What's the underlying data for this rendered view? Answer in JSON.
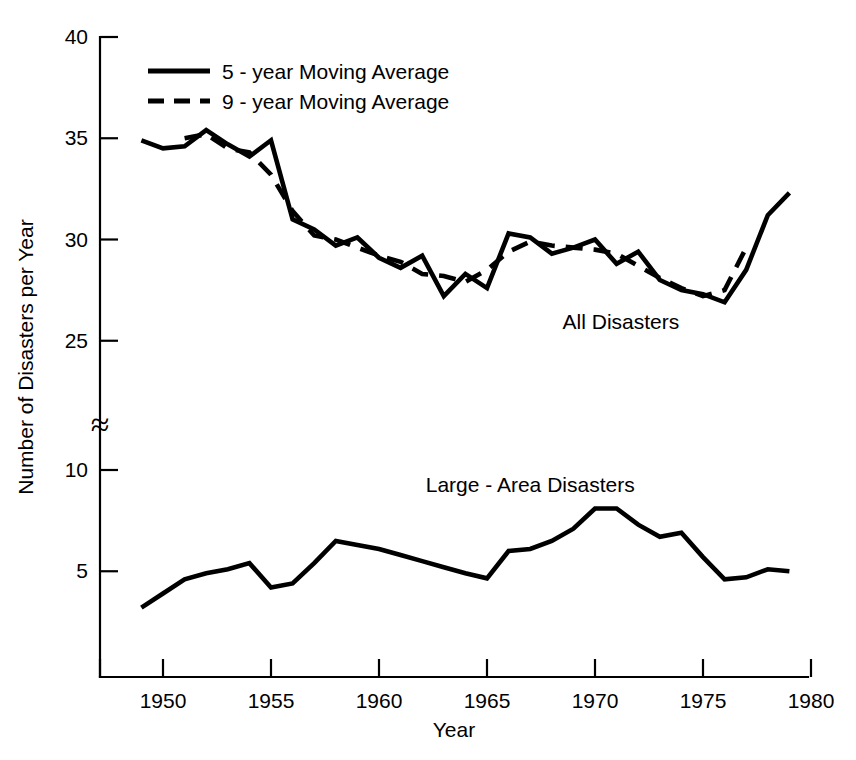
{
  "chart_data": {
    "type": "line",
    "title": "",
    "xlabel": "Year",
    "ylabel": "Number of Disasters per Year",
    "xlim": [
      1947,
      1980
    ],
    "ylim_upper": [
      25,
      40
    ],
    "ylim_lower": [
      0,
      12
    ],
    "axis_break": true,
    "axis_break_symbol": "≈",
    "grid": false,
    "legend_position": "top-left",
    "x_ticks": [
      1950,
      1955,
      1960,
      1965,
      1970,
      1975,
      1980
    ],
    "x_tick_labels": [
      "1950",
      "1955",
      "1960",
      "1965",
      "1970",
      "1975",
      "1980"
    ],
    "y_ticks_upper": [
      25,
      30,
      35,
      40
    ],
    "y_tick_labels_upper": [
      "25",
      "30",
      "35",
      "40"
    ],
    "y_ticks_lower": [
      5,
      10
    ],
    "y_tick_labels_lower": [
      "5",
      "10"
    ],
    "legend": [
      {
        "label": "5 - year Moving Average",
        "style": "solid"
      },
      {
        "label": "9 - year Moving Average",
        "style": "dashed"
      }
    ],
    "annotations": [
      {
        "text": "All Disasters",
        "x": 1971.2,
        "y": 25.6
      },
      {
        "text": "Large - Area Disasters",
        "x": 1967.0,
        "y": 8.9
      }
    ],
    "series": [
      {
        "name": "All Disasters — 5 - year Moving Average",
        "style": "solid",
        "panel": "upper",
        "x": [
          1949,
          1950,
          1951,
          1952,
          1953,
          1954,
          1955,
          1956,
          1957,
          1958,
          1959,
          1960,
          1961,
          1962,
          1963,
          1964,
          1965,
          1966,
          1967,
          1968,
          1969,
          1970,
          1971,
          1972,
          1973,
          1974,
          1975,
          1976,
          1977,
          1978,
          1979
        ],
        "values": [
          34.9,
          34.5,
          34.6,
          35.4,
          34.7,
          34.1,
          34.9,
          31.0,
          30.5,
          29.7,
          30.1,
          29.1,
          28.6,
          29.2,
          27.2,
          28.3,
          27.6,
          30.3,
          30.1,
          29.3,
          29.6,
          30.0,
          28.8,
          29.4,
          28.0,
          27.5,
          27.3,
          26.9,
          28.5,
          31.2,
          32.3
        ]
      },
      {
        "name": "All Disasters — 9 - year Moving Average",
        "style": "dashed",
        "panel": "upper",
        "x": [
          1951,
          1952,
          1953,
          1954,
          1955,
          1956,
          1957,
          1958,
          1959,
          1960,
          1961,
          1962,
          1963,
          1964,
          1965,
          1966,
          1967,
          1968,
          1969,
          1970,
          1971,
          1972,
          1973,
          1974,
          1975,
          1976,
          1977
        ],
        "values": [
          35.0,
          35.2,
          34.5,
          34.3,
          33.2,
          31.4,
          30.2,
          30.0,
          29.6,
          29.2,
          28.9,
          28.3,
          28.2,
          27.9,
          28.5,
          29.4,
          29.9,
          29.7,
          29.6,
          29.5,
          29.3,
          28.7,
          28.1,
          27.6,
          27.2,
          27.5,
          29.6
        ]
      },
      {
        "name": "Large - Area Disasters",
        "style": "solid",
        "panel": "lower",
        "x": [
          1949,
          1950,
          1951,
          1952,
          1953,
          1954,
          1955,
          1956,
          1957,
          1958,
          1959,
          1960,
          1961,
          1962,
          1963,
          1964,
          1965,
          1966,
          1967,
          1968,
          1969,
          1970,
          1971,
          1972,
          1973,
          1974,
          1975,
          1976,
          1977,
          1978,
          1979
        ],
        "values": [
          3.2,
          3.9,
          4.6,
          4.9,
          5.1,
          5.4,
          4.2,
          4.4,
          5.4,
          6.5,
          6.3,
          6.1,
          5.8,
          5.5,
          5.2,
          4.9,
          4.65,
          6.0,
          6.1,
          6.5,
          7.1,
          8.1,
          8.1,
          7.3,
          6.7,
          6.9,
          5.7,
          4.6,
          4.7,
          5.1,
          5.0
        ]
      }
    ]
  },
  "layout": {
    "plot_left_px": 100,
    "plot_right_px": 808,
    "plot_top_px": 37,
    "plot_bottom_px": 677,
    "upper_ref_value": 40,
    "upper_ref_px": 37,
    "upper_px_per_unit": 20.25,
    "lower_ref_value": 10,
    "lower_ref_px": 470,
    "lower_px_per_unit": 20.25,
    "x_ref_year": 1950,
    "x_ref_px": 163,
    "x_px_per_year": 21.6,
    "break_y_px": 425
  }
}
